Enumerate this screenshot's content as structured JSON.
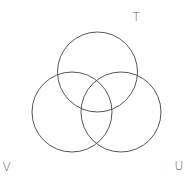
{
  "diagram": {
    "type": "venn",
    "set_count": 3,
    "sets": [
      {
        "id": "T",
        "label": "T",
        "cx": 97.5,
        "cy": 72,
        "r": 40,
        "label_x": 132.5,
        "label_y": 20.5
      },
      {
        "id": "V",
        "label": "V",
        "cx": 72,
        "cy": 112,
        "r": 40,
        "label_x": 2.5,
        "label_y": 171
      },
      {
        "id": "U",
        "label": "U",
        "cx": 121,
        "cy": 112,
        "r": 40,
        "label_x": 174.5,
        "label_y": 170
      }
    ],
    "colors": {
      "stroke": "#555555",
      "label": "#666666",
      "background": "#ffffff"
    }
  }
}
